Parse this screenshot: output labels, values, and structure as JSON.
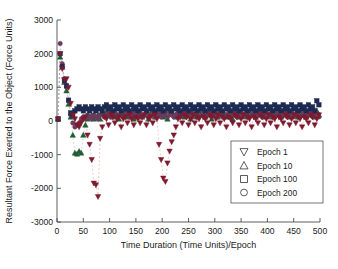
{
  "chart_data": {
    "type": "scatter",
    "title": "",
    "xlabel": "Time Duration (Time Units)/Epoch",
    "ylabel": "Resultant Force Exerted to the Object (Force Units)",
    "xlim": [
      0,
      500
    ],
    "ylim": [
      -3000,
      3000
    ],
    "xticks": [
      0,
      50,
      100,
      150,
      200,
      250,
      300,
      350,
      400,
      450,
      500
    ],
    "yticks": [
      -3000,
      -2000,
      -1000,
      0,
      1000,
      2000,
      3000
    ],
    "xtick_labels": [
      "0",
      "50",
      "100",
      "150",
      "200",
      "250",
      "300",
      "350",
      "400",
      "450",
      "500"
    ],
    "ytick_labels": [
      "-3000",
      "-2000",
      "-1000",
      "0",
      "1000",
      "2000",
      "3000"
    ],
    "grid": false,
    "legend_position": "lower right",
    "connector_lines": "dashed",
    "series": [
      {
        "name": "Epoch 1",
        "marker": "triangle-down",
        "color": "#7d1b2e",
        "line_color": "#e08a8a",
        "x": [
          2,
          6,
          10,
          14,
          18,
          22,
          26,
          30,
          34,
          38,
          42,
          46,
          50,
          54,
          58,
          62,
          66,
          70,
          74,
          78,
          82,
          86,
          90,
          94,
          98,
          102,
          106,
          110,
          114,
          118,
          122,
          126,
          130,
          134,
          138,
          142,
          146,
          150,
          154,
          158,
          162,
          166,
          170,
          174,
          178,
          182,
          186,
          190,
          194,
          198,
          202,
          206,
          210,
          214,
          218,
          222,
          226,
          230,
          234,
          238,
          242,
          246,
          250,
          254,
          258,
          262,
          266,
          270,
          274,
          278,
          282,
          286,
          290,
          294,
          298,
          302,
          306,
          310,
          314,
          318,
          322,
          326,
          330,
          334,
          338,
          342,
          346,
          350,
          354,
          358,
          362,
          366,
          370,
          374,
          378,
          382,
          386,
          390,
          394,
          398,
          402,
          406,
          410,
          414,
          418,
          422,
          426,
          430,
          434,
          438,
          442,
          446,
          450,
          454,
          458,
          462,
          466,
          470,
          474,
          478,
          482,
          486,
          490,
          494,
          498
        ],
        "y": [
          60,
          1990,
          1550,
          1230,
          1250,
          1000,
          520,
          180,
          60,
          -120,
          -180,
          -60,
          60,
          120,
          -420,
          -700,
          -1150,
          -1850,
          -1900,
          -2250,
          -520,
          -180,
          120,
          60,
          -120,
          180,
          120,
          -60,
          60,
          120,
          -180,
          60,
          120,
          -60,
          180,
          60,
          -120,
          120,
          60,
          -60,
          120,
          180,
          -120,
          60,
          120,
          -60,
          180,
          60,
          -700,
          -1150,
          -1700,
          -1800,
          -1250,
          -900,
          -620,
          -420,
          -180,
          60,
          120,
          -60,
          180,
          120,
          -120,
          60,
          180,
          -60,
          120,
          60,
          -180,
          120,
          60,
          -60,
          180,
          120,
          -120,
          60,
          180,
          -60,
          120,
          60,
          -180,
          120,
          60,
          -60,
          180,
          120,
          -120,
          60,
          180,
          -60,
          120,
          60,
          -180,
          120,
          60,
          -60,
          180,
          120,
          -120,
          60,
          180,
          -60,
          120,
          60,
          -180,
          120,
          60,
          -60,
          180,
          120,
          -120,
          60,
          180,
          -60,
          120,
          60,
          -180,
          120,
          60,
          -60,
          180,
          120,
          -120,
          60,
          180
        ]
      },
      {
        "name": "Epoch 10",
        "marker": "triangle-up",
        "color": "#1f5c33",
        "line_color": "#8fbf9f",
        "x": [
          2,
          6,
          10,
          14,
          18,
          22,
          26,
          30,
          34,
          38,
          42,
          46,
          50,
          54,
          58,
          62,
          66,
          70,
          74,
          78,
          82,
          86,
          90,
          94,
          98,
          102,
          106,
          110,
          114,
          118,
          122,
          126,
          130,
          134,
          138,
          142,
          146,
          150,
          154,
          158,
          162,
          166,
          170,
          174,
          178,
          182,
          186,
          190,
          194,
          198,
          202,
          206,
          210,
          214,
          218,
          222,
          226,
          230,
          234,
          238,
          242,
          246,
          250,
          254,
          258,
          262,
          266,
          270,
          274,
          278,
          282,
          286,
          290,
          294,
          298,
          302,
          306,
          310,
          314,
          318,
          322,
          326,
          330,
          334,
          338,
          342,
          346,
          350,
          354,
          358,
          362,
          366,
          370,
          374,
          378,
          382,
          386,
          390,
          394,
          398,
          402,
          406,
          410,
          414,
          418,
          422,
          426,
          430,
          434,
          438,
          442,
          446,
          450,
          454,
          458,
          462,
          466,
          470,
          474,
          478,
          482,
          486,
          490,
          494,
          498
        ],
        "y": [
          60,
          1900,
          1600,
          1150,
          900,
          500,
          120,
          -420,
          -950,
          -980,
          -900,
          -950,
          -420,
          -120,
          60,
          120,
          180,
          60,
          120,
          180,
          60,
          240,
          180,
          300,
          180,
          240,
          120,
          300,
          180,
          60,
          240,
          180,
          300,
          120,
          240,
          180,
          60,
          300,
          180,
          240,
          120,
          180,
          300,
          60,
          240,
          180,
          120,
          300,
          180,
          240,
          120,
          180,
          60,
          300,
          240,
          180,
          120,
          300,
          180,
          240,
          120,
          180,
          300,
          60,
          240,
          180,
          120,
          300,
          180,
          240,
          120,
          180,
          300,
          60,
          240,
          180,
          120,
          300,
          180,
          240,
          120,
          180,
          300,
          60,
          240,
          180,
          120,
          300,
          180,
          240,
          120,
          300,
          180,
          240,
          120,
          300,
          180,
          240,
          120,
          300,
          180,
          240,
          120,
          300,
          180,
          240,
          120,
          300,
          180,
          240,
          120,
          300,
          180,
          240,
          120,
          300,
          180,
          240,
          120,
          300,
          180,
          240,
          120,
          300,
          180
        ]
      },
      {
        "name": "Epoch 100",
        "marker": "square",
        "color": "#1c2a52",
        "line_color": "#9aa3c0",
        "x": [
          2,
          6,
          10,
          14,
          18,
          22,
          26,
          30,
          34,
          38,
          42,
          46,
          50,
          54,
          58,
          62,
          66,
          70,
          74,
          78,
          82,
          86,
          90,
          94,
          98,
          102,
          106,
          110,
          114,
          118,
          122,
          126,
          130,
          134,
          138,
          142,
          146,
          150,
          154,
          158,
          162,
          166,
          170,
          174,
          178,
          182,
          186,
          190,
          194,
          198,
          202,
          206,
          210,
          214,
          218,
          222,
          226,
          230,
          234,
          238,
          242,
          246,
          250,
          254,
          258,
          262,
          266,
          270,
          274,
          278,
          282,
          286,
          290,
          294,
          298,
          302,
          306,
          310,
          314,
          318,
          322,
          326,
          330,
          334,
          338,
          342,
          346,
          350,
          354,
          358,
          362,
          366,
          370,
          374,
          378,
          382,
          386,
          390,
          394,
          398,
          402,
          406,
          410,
          414,
          418,
          422,
          426,
          430,
          434,
          438,
          442,
          446,
          450,
          454,
          458,
          462,
          466,
          470,
          474,
          478,
          482,
          486,
          490,
          494,
          498
        ],
        "y": [
          60,
          2000,
          1620,
          1200,
          1050,
          620,
          240,
          180,
          300,
          360,
          420,
          360,
          300,
          420,
          360,
          300,
          420,
          360,
          300,
          420,
          360,
          300,
          420,
          480,
          360,
          420,
          300,
          480,
          360,
          420,
          300,
          480,
          360,
          420,
          300,
          480,
          360,
          420,
          300,
          480,
          360,
          420,
          300,
          480,
          360,
          420,
          300,
          480,
          360,
          420,
          300,
          480,
          360,
          420,
          300,
          480,
          360,
          420,
          300,
          480,
          360,
          420,
          300,
          480,
          360,
          420,
          300,
          480,
          360,
          420,
          300,
          480,
          360,
          420,
          300,
          480,
          360,
          420,
          300,
          480,
          360,
          420,
          300,
          480,
          360,
          420,
          300,
          480,
          360,
          420,
          300,
          480,
          360,
          420,
          300,
          480,
          360,
          420,
          300,
          480,
          360,
          420,
          300,
          480,
          360,
          420,
          300,
          480,
          360,
          420,
          300,
          480,
          360,
          420,
          300,
          480,
          360,
          420,
          300,
          480,
          360,
          420,
          300,
          600,
          480
        ]
      },
      {
        "name": "Epoch 200",
        "marker": "circle",
        "color": "#6b3a5e",
        "line_color": "#b59ab0",
        "x": [
          2,
          6,
          10,
          14,
          18,
          22,
          26,
          30,
          34,
          38,
          42,
          46,
          50,
          54,
          58,
          62,
          66,
          70,
          74,
          78,
          82,
          86,
          90,
          94,
          98,
          102,
          106,
          110,
          114,
          118,
          122,
          126,
          130,
          134,
          138,
          142,
          146,
          150,
          154,
          158,
          162,
          166,
          170,
          174,
          178,
          182,
          186,
          190,
          194,
          198,
          202,
          206,
          210,
          214,
          218,
          222,
          226,
          230,
          234,
          238,
          242,
          246,
          250,
          254,
          258,
          262,
          266,
          270,
          274,
          278,
          282,
          286,
          290,
          294,
          298,
          302,
          306,
          310,
          314,
          318,
          322,
          326,
          330,
          334,
          338,
          342,
          346,
          350,
          354,
          358,
          362,
          366,
          370,
          374,
          378,
          382,
          386,
          390,
          394,
          398,
          402,
          406,
          410,
          414,
          418,
          422,
          426,
          430,
          434,
          438,
          442,
          446,
          450,
          454,
          458,
          462,
          466,
          470,
          474,
          478,
          482,
          486,
          490,
          494,
          498
        ],
        "y": [
          60,
          2300,
          1700,
          1250,
          1000,
          600,
          180,
          -60,
          -180,
          -120,
          -60,
          60,
          120,
          60,
          180,
          120,
          60,
          180,
          120,
          60,
          180,
          240,
          120,
          180,
          240,
          120,
          180,
          240,
          120,
          180,
          240,
          120,
          180,
          240,
          120,
          180,
          240,
          120,
          180,
          240,
          120,
          180,
          240,
          120,
          180,
          240,
          120,
          180,
          240,
          120,
          180,
          240,
          120,
          180,
          240,
          120,
          180,
          240,
          120,
          180,
          240,
          120,
          180,
          240,
          120,
          180,
          240,
          120,
          180,
          240,
          120,
          180,
          240,
          120,
          180,
          240,
          120,
          180,
          240,
          120,
          180,
          240,
          120,
          180,
          240,
          120,
          180,
          240,
          120,
          180,
          240,
          120,
          180,
          240,
          120,
          180,
          240,
          120,
          180,
          240,
          120,
          180,
          240,
          120,
          180,
          240,
          120,
          180,
          240,
          120,
          180,
          240,
          120,
          180,
          240,
          120,
          180,
          240,
          120,
          180,
          240,
          120,
          180,
          240,
          120
        ]
      }
    ],
    "legend": [
      {
        "label": "Epoch 1",
        "marker": "triangle-down"
      },
      {
        "label": "Epoch 10",
        "marker": "triangle-up"
      },
      {
        "label": "Epoch 100",
        "marker": "square"
      },
      {
        "label": "Epoch 200",
        "marker": "circle"
      }
    ]
  }
}
